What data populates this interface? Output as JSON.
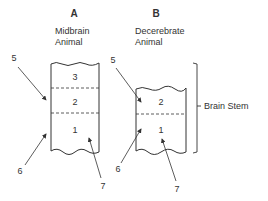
{
  "panels": [
    {
      "letter": "A",
      "title_line1": "Midbrain",
      "title_line2": "Animal",
      "segments": [
        "3",
        "2",
        "1"
      ],
      "arrows": {
        "top": "5",
        "bottom_left": "6",
        "bottom_right": "7"
      }
    },
    {
      "letter": "B",
      "title_line1": "Decerebrate",
      "title_line2": "Animal",
      "segments": [
        "2",
        "1"
      ],
      "arrows": {
        "top": "5",
        "bottom_left": "6",
        "bottom_right": "7"
      }
    }
  ],
  "bracket_label": "Brain Stem",
  "colors": {
    "ink": "#333333",
    "background": "#ffffff"
  }
}
